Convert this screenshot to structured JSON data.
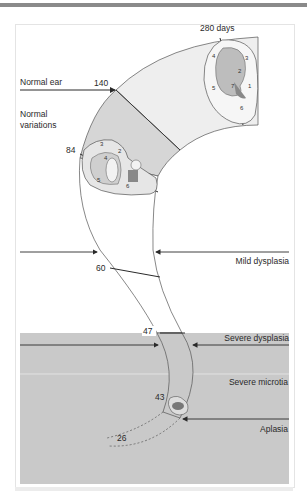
{
  "figure": {
    "stage_labels": {
      "d280": "280 days",
      "d140": "140",
      "d84": "84",
      "d60": "60",
      "d47": "47",
      "d43": "43",
      "d26": "26"
    },
    "zone_labels": {
      "normal_ear": "Normal ear",
      "normal_variations_1": "Normal",
      "normal_variations_2": "variations",
      "mild_dysplasia": "Mild dysplasia",
      "severe_dysplasia": "Severe dysplasia",
      "severe_microtia": "Severe microtia",
      "aplasia": "Aplasia"
    },
    "ear_part_numbers_280": [
      "1",
      "2",
      "3",
      "4",
      "5",
      "6",
      "7"
    ],
    "ear_part_numbers_84": [
      "3",
      "4",
      "2",
      "5",
      "6"
    ],
    "colors": {
      "band_light": "#eeeeee",
      "band_mid": "#d6d6d6",
      "severe_region": "#c9c9c9",
      "line": "#2a2a2a",
      "top_bar": "#8a8a8a"
    }
  }
}
